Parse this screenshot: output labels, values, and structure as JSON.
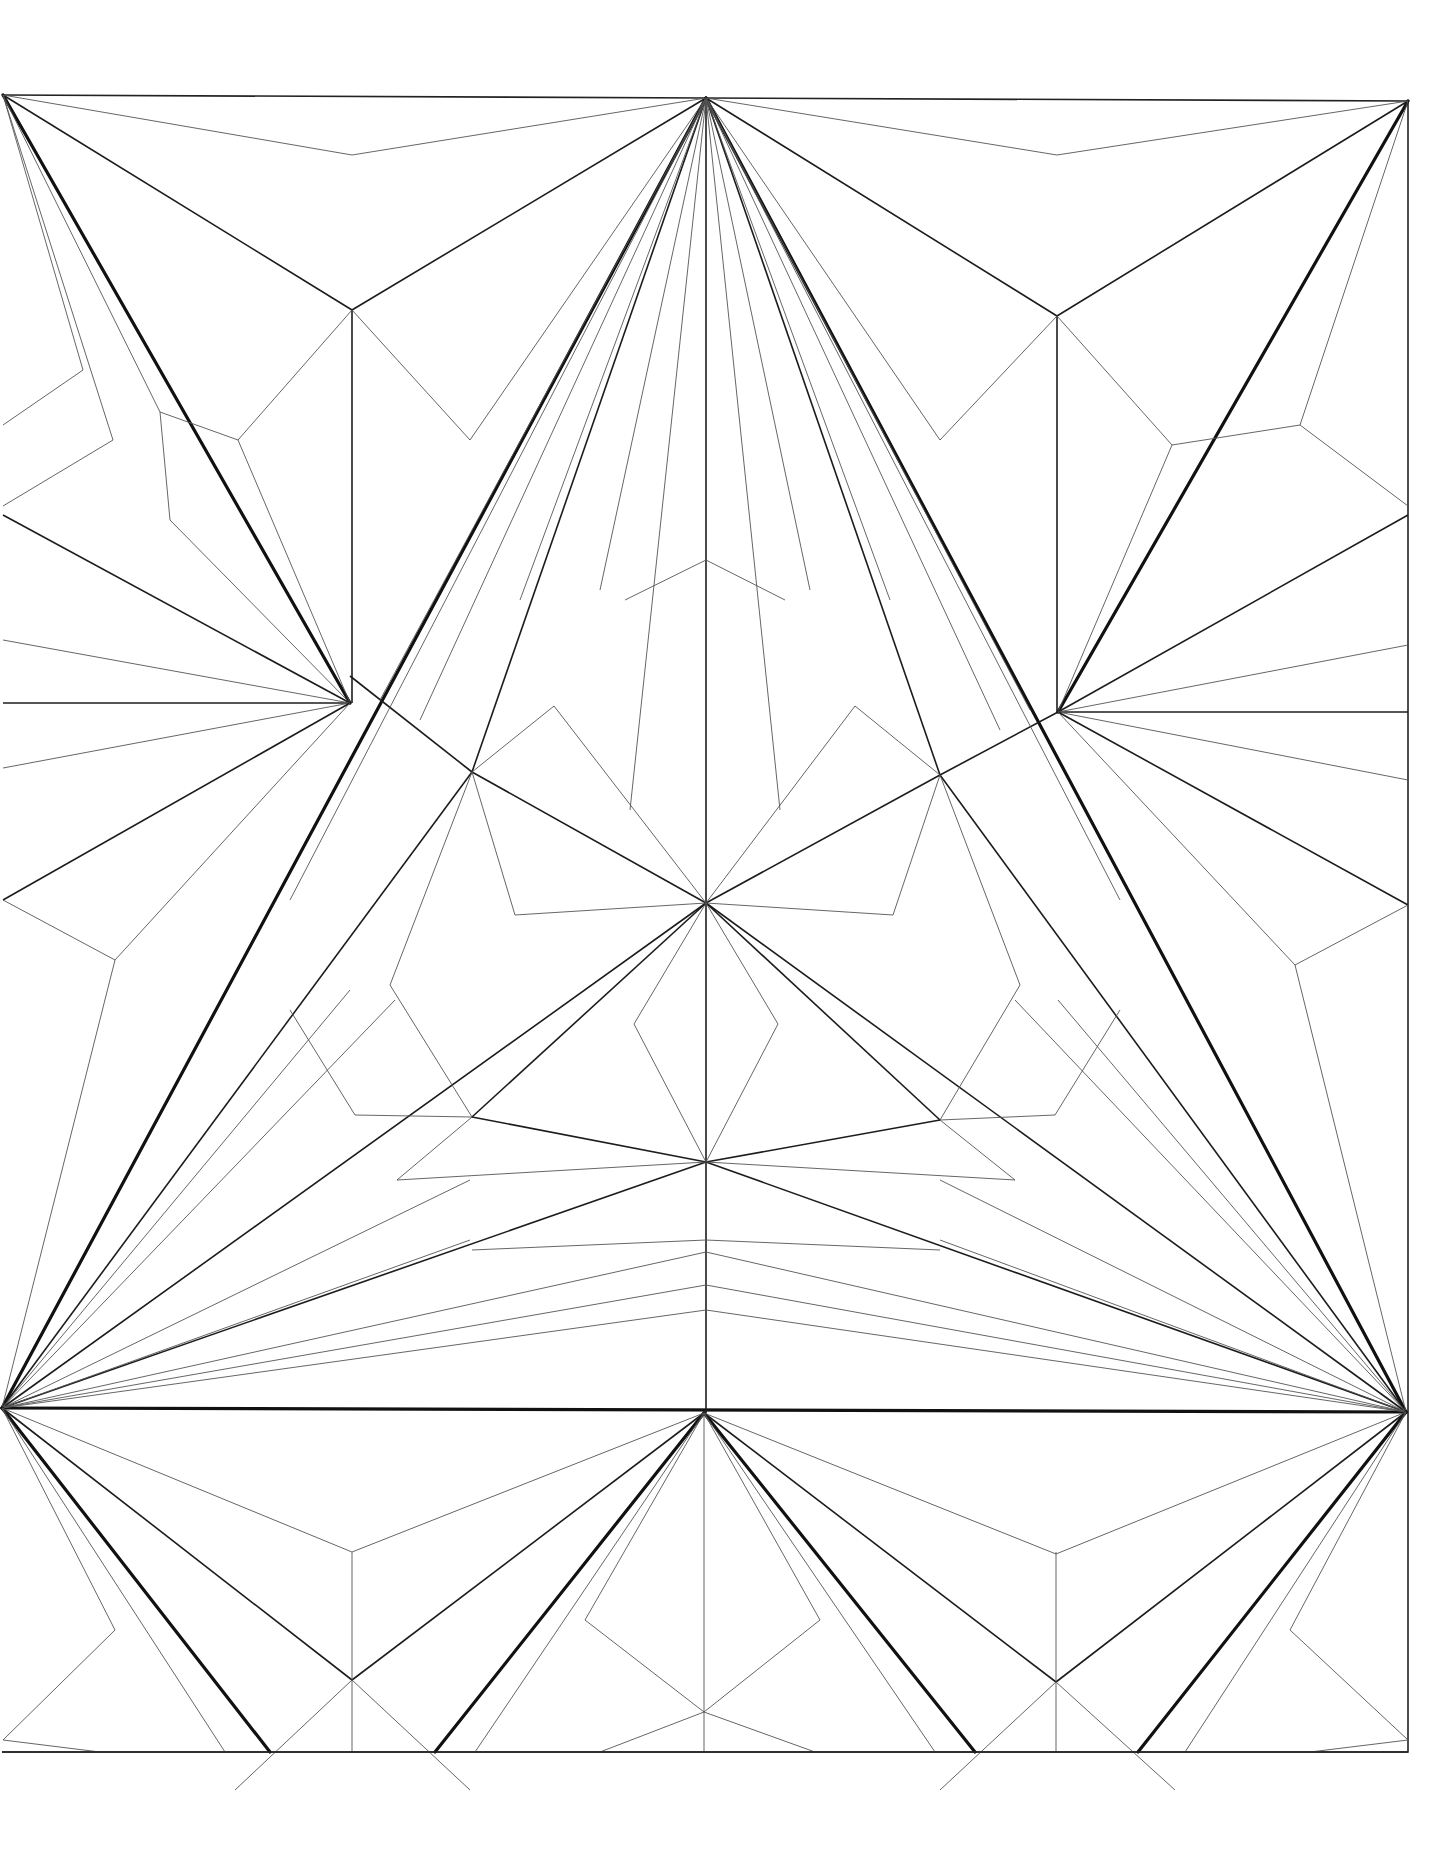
{
  "diagram": {
    "title": "",
    "type": "origami-crease-pattern",
    "colors": {
      "background": "#ffffff",
      "line": "#111111",
      "thin_line": "#555555"
    },
    "points": {
      "A": [
        3,
        95
      ],
      "T": [
        706,
        98
      ],
      "C": [
        1408,
        101
      ],
      "L": [
        350,
        676
      ],
      "R": [
        1058,
        712
      ],
      "LE": [
        3,
        703
      ],
      "RE": [
        1408,
        712
      ],
      "O": [
        706,
        903
      ],
      "M": [
        706,
        1162
      ],
      "BL": [
        2,
        1408
      ],
      "BR": [
        1406,
        1412
      ],
      "BM": [
        704,
        1413
      ],
      "UL": [
        472,
        772
      ],
      "UR": [
        940,
        775
      ],
      "DL": [
        472,
        1117
      ],
      "DR": [
        940,
        1120
      ],
      "QTL": [
        352,
        310
      ],
      "QTR": [
        1057,
        316
      ],
      "QBL": [
        354,
        1841
      ],
      "QBR": [
        1058,
        1841
      ],
      "BOTTOM_Y": 1752
    }
  }
}
